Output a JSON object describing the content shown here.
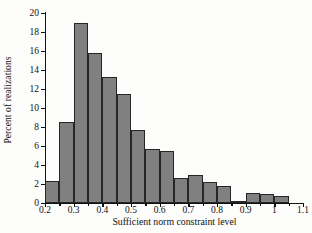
{
  "chart_data": {
    "type": "bar",
    "title": "",
    "xlabel": "Sufficient norm constraint level",
    "ylabel": "Percent of realizations",
    "xlim": [
      0.2,
      1.1
    ],
    "ylim": [
      0,
      20
    ],
    "grid": false,
    "legend": null,
    "bin_width": 0.05,
    "bar_color": "#808080",
    "bar_edge_color": "#262626",
    "axis_color": "#111111",
    "background_color": "#fdfdfb",
    "categories": [
      "0.20-0.25",
      "0.25-0.30",
      "0.30-0.35",
      "0.35-0.40",
      "0.40-0.45",
      "0.45-0.50",
      "0.50-0.55",
      "0.55-0.60",
      "0.60-0.65",
      "0.65-0.70",
      "0.70-0.75",
      "0.75-0.80",
      "0.80-0.85",
      "0.85-0.90",
      "0.90-0.95",
      "0.95-1.00",
      "1.00-1.05",
      "1.05-1.10"
    ],
    "bin_starts": [
      0.2,
      0.25,
      0.3,
      0.35,
      0.4,
      0.45,
      0.5,
      0.55,
      0.6,
      0.65,
      0.7,
      0.75,
      0.8,
      0.85,
      0.9,
      0.95,
      1.0,
      1.05
    ],
    "values": [
      2.3,
      8.5,
      19.0,
      15.8,
      13.3,
      11.5,
      7.7,
      5.7,
      5.5,
      2.6,
      2.9,
      2.2,
      1.8,
      0.2,
      1.1,
      0.9,
      0.7,
      0.0
    ],
    "xticks": [
      0.2,
      0.3,
      0.4,
      0.5,
      0.6,
      0.7,
      0.8,
      0.9,
      1.0,
      1.1
    ],
    "xtick_labels": [
      "0.2",
      "0.3",
      "0.4",
      "0.5",
      "0.6",
      "0.7",
      "0.8",
      "0.9",
      "1",
      "1.1"
    ],
    "yticks": [
      0,
      2,
      4,
      6,
      8,
      10,
      12,
      14,
      16,
      18,
      20
    ],
    "ytick_labels": [
      "0",
      "2",
      "4",
      "6",
      "8",
      "10",
      "12",
      "14",
      "16",
      "18",
      "20"
    ]
  }
}
